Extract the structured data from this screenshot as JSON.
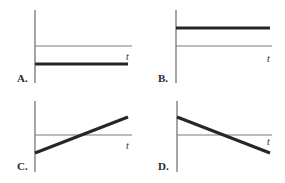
{
  "chart_data": [
    {
      "type": "line",
      "panel": "A.",
      "xlabel": "t",
      "ylabel": "",
      "reference_line": 0,
      "series": [
        {
          "name": "graph",
          "x": [
            0,
            1
          ],
          "values": [
            -0.5,
            -0.5
          ]
        }
      ],
      "description": "constant negative value"
    },
    {
      "type": "line",
      "panel": "B.",
      "xlabel": "t",
      "ylabel": "",
      "reference_line": 0,
      "series": [
        {
          "name": "graph",
          "x": [
            0,
            1
          ],
          "values": [
            0.5,
            0.5
          ]
        }
      ],
      "description": "constant positive value"
    },
    {
      "type": "line",
      "panel": "C.",
      "xlabel": "t",
      "ylabel": "",
      "reference_line": 0,
      "series": [
        {
          "name": "graph",
          "x": [
            0,
            1
          ],
          "values": [
            -0.5,
            0.5
          ]
        }
      ],
      "description": "increasing linearly from negative to positive"
    },
    {
      "type": "line",
      "panel": "D.",
      "xlabel": "t",
      "ylabel": "",
      "reference_line": 0,
      "series": [
        {
          "name": "graph",
          "x": [
            0,
            1
          ],
          "values": [
            0.5,
            -0.5
          ]
        }
      ],
      "description": "decreasing linearly from positive to negative"
    }
  ]
}
